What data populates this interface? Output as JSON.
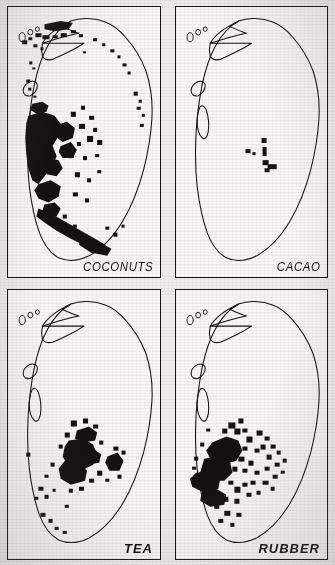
{
  "figure": {
    "title_visible": false,
    "panel_count": 4,
    "ink_color": "#141210",
    "paper_color": "#f2f1ee",
    "map_fill": "#f6f5f2"
  },
  "panels": [
    {
      "id": "coconuts",
      "label": "COCONUTS",
      "label_style": "italic-regular",
      "position": "top-left",
      "dot_density": "very high",
      "distribution_summary": "Dense concentration along the west / south-west coastal lowland between Negombo, Colombo and Kalutara, extending inland; scattered dots along the north-west coast, the southern coast near Matara / Hambantota and sparse dots on the east coast."
    },
    {
      "id": "cacao",
      "label": "CACAO",
      "label_style": "italic-regular",
      "position": "top-right",
      "dot_density": "very low",
      "distribution_summary": "A handful of dots only, clustered in the central Matale / Kandy district of the interior hill country."
    },
    {
      "id": "tea",
      "label": "TEA",
      "label_style": "italic-bold",
      "position": "bottom-left",
      "dot_density": "high",
      "distribution_summary": "Concentrated block in the central highlands around Nuwara Eliya, Kandy, Badulla and Dimbula, with a secondary group to the east and outliers in the low-country south-west (Ratnapura, Galle)."
    },
    {
      "id": "rubber",
      "label": "RUBBER",
      "label_style": "italic-bold",
      "position": "bottom-right",
      "dot_density": "high",
      "distribution_summary": "Main belt in the south-western wet zone foothills around Kegalle, Ratnapura and Kalutara, thinning eastward into the Uva basin with scattered outliers."
    }
  ],
  "map": {
    "country": "Sri Lanka",
    "features": [
      "coastline outline",
      "Jaffna peninsula",
      "north-western offshore islets",
      "Puttalam lagoon",
      "Kalpitiya spit",
      "Trincomalee bay indentation",
      "Batticaloa lagoon"
    ],
    "symbol": "filled black dot = production locality"
  }
}
